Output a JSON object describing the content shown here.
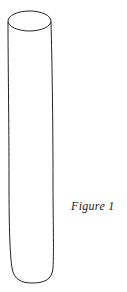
{
  "figure": {
    "caption": "Figure  1",
    "stroke_color": "#222222",
    "background_color": "#ffffff"
  }
}
